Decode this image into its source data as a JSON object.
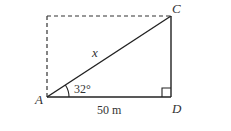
{
  "diagram": {
    "type": "right-triangle",
    "points": {
      "A": {
        "label": "A"
      },
      "C": {
        "label": "C"
      },
      "D": {
        "label": "D"
      }
    },
    "hypotenuse_label": "x",
    "angle_label": "32°",
    "base_label": "50 m",
    "right_angle_at": "D",
    "dashed_rectangle_completion": true,
    "colors": {
      "line": "#222222",
      "text": "#333333"
    }
  }
}
